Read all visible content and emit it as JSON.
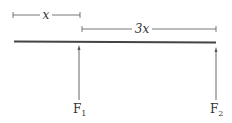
{
  "diagram": {
    "type": "beam-force-diagram",
    "dimension_labels": {
      "left_span": "x",
      "right_span": "3x"
    },
    "forces": [
      {
        "label": "F",
        "subscript": "1"
      },
      {
        "label": "F",
        "subscript": "2"
      }
    ],
    "colors": {
      "beam": "#444444",
      "lines": "#555555"
    }
  }
}
